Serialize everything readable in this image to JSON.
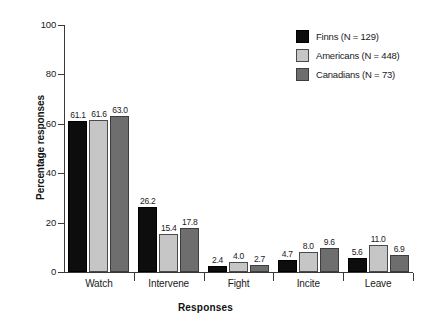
{
  "chart_data": {
    "type": "bar",
    "title": "",
    "xlabel": "Responses",
    "ylabel": "Percentage responses",
    "categories": [
      "Watch",
      "Intervene",
      "Fight",
      "Incite",
      "Leave"
    ],
    "series": [
      {
        "name": "Finns (N = 129)",
        "color": "#0d0d0d",
        "values": [
          61.1,
          26.2,
          2.4,
          4.7,
          5.6
        ]
      },
      {
        "name": "Americans (N = 448)",
        "color": "#c6c6c6",
        "values": [
          61.6,
          15.4,
          4.0,
          8.0,
          11.0
        ]
      },
      {
        "name": "Canadians (N = 73)",
        "color": "#6e6e6e",
        "values": [
          63.0,
          17.8,
          2.7,
          9.6,
          6.9
        ]
      }
    ],
    "value_labels": [
      [
        "61.1",
        "61.6",
        "63.0"
      ],
      [
        "26.2",
        "15.4",
        "17.8"
      ],
      [
        "2.4",
        "4.0",
        "2.7"
      ],
      [
        "4.7",
        "8.0",
        "9.6"
      ],
      [
        "5.6",
        "11.0",
        "6.9"
      ]
    ],
    "ylim": [
      0,
      100
    ],
    "yticks": [
      0,
      20,
      40,
      60,
      80,
      100
    ],
    "ytick_labels": [
      "0",
      "20",
      "40",
      "60",
      "80",
      "100"
    ],
    "grid": false,
    "legend_position": "top-right"
  },
  "legend": {
    "entries": [
      {
        "label": "Finns (N = 129)"
      },
      {
        "label": "Americans (N = 448)"
      },
      {
        "label": "Canadians (N = 73)"
      }
    ]
  },
  "axes": {
    "y_title": "Percentage responses",
    "x_title": "Responses"
  }
}
